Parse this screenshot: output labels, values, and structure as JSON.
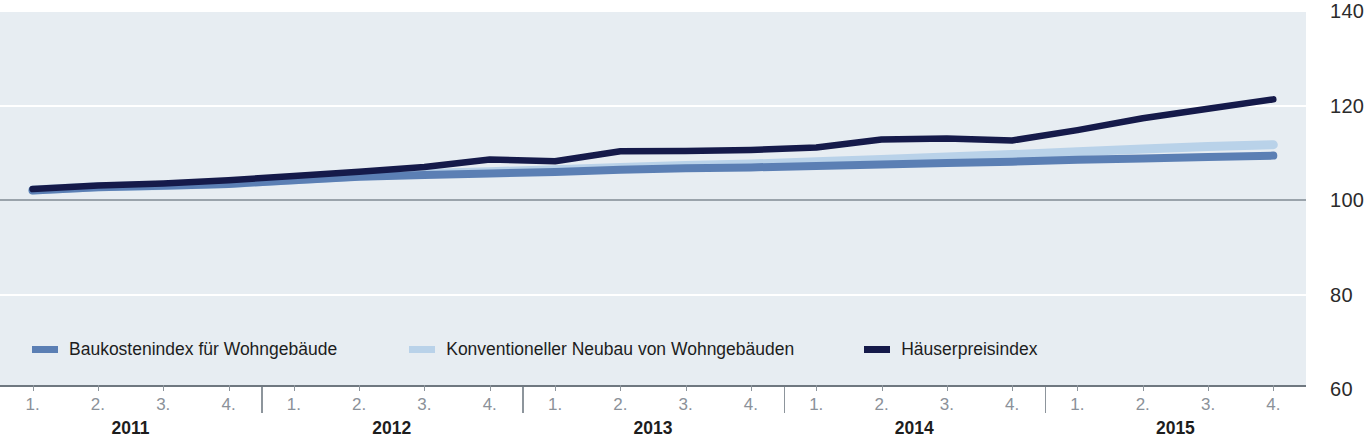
{
  "chart_data": {
    "type": "line",
    "title": "",
    "subtitle": "",
    "xlabel": "",
    "ylabel": "",
    "ylim": [
      60,
      140
    ],
    "yticks": [
      140,
      120,
      100,
      80,
      60
    ],
    "grid": true,
    "legend_position": "bottom-left",
    "index_base": 100,
    "x": [
      "2011 1.",
      "2011 2.",
      "2011 3.",
      "2011 4.",
      "2012 1.",
      "2012 2.",
      "2012 3.",
      "2012 4.",
      "2013 1.",
      "2013 2.",
      "2013 3.",
      "2013 4.",
      "2014 1.",
      "2014 2.",
      "2014 3.",
      "2014 4.",
      "2015 1.",
      "2015 2.",
      "2015 3.",
      "2015 4."
    ],
    "quarter_labels": [
      "1.",
      "2.",
      "3.",
      "4."
    ],
    "year_labels": [
      "2011",
      "2012",
      "2013",
      "2014",
      "2015"
    ],
    "series": [
      {
        "name": "Baukostenindex für Wohngebäude",
        "color": "#5b7fb4",
        "values": [
          102.0,
          102.7,
          103.0,
          103.4,
          104.2,
          104.9,
          105.3,
          105.6,
          105.9,
          106.4,
          106.7,
          106.9,
          107.2,
          107.5,
          107.8,
          108.1,
          108.5,
          108.8,
          109.1,
          109.4
        ]
      },
      {
        "name": "Konventioneller Neubau von Wohngebäuden",
        "color": "#b9d2e9",
        "values": [
          102.1,
          102.8,
          103.1,
          103.5,
          104.3,
          105.1,
          105.6,
          106.0,
          106.4,
          106.9,
          107.3,
          107.6,
          108.1,
          108.6,
          109.1,
          109.6,
          110.2,
          110.8,
          111.3,
          111.7
        ]
      },
      {
        "name": "Häuserpreisindex",
        "color": "#151a4a",
        "values": [
          102.3,
          103.1,
          103.5,
          104.2,
          105.1,
          106.0,
          107.0,
          108.6,
          108.2,
          110.3,
          110.4,
          110.6,
          111.1,
          112.8,
          113.0,
          112.6,
          114.8,
          117.3,
          119.3,
          121.3
        ]
      }
    ]
  },
  "axis": {
    "y_tick_labels": [
      "140",
      "120",
      "100",
      "80",
      "60"
    ]
  },
  "legend": {
    "items": [
      {
        "label": "Baukostenindex für Wohngebäude",
        "color": "#5b7fb4"
      },
      {
        "label": "Konventioneller Neubau von Wohngebäuden",
        "color": "#b9d2e9"
      },
      {
        "label": "Häuserpreisindex",
        "color": "#151a4a"
      }
    ]
  }
}
